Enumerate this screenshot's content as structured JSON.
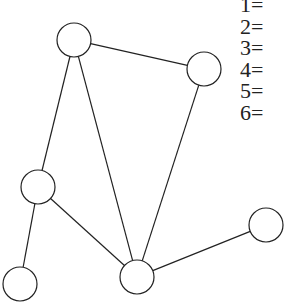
{
  "diagram": {
    "type": "graph",
    "nodes": [
      {
        "id": "n1",
        "cx": 74,
        "cy": 40,
        "r": 17
      },
      {
        "id": "n2",
        "cx": 204,
        "cy": 69,
        "r": 17
      },
      {
        "id": "n3",
        "cx": 38,
        "cy": 187,
        "r": 17
      },
      {
        "id": "n4",
        "cx": 266,
        "cy": 225,
        "r": 17
      },
      {
        "id": "n5",
        "cx": 20,
        "cy": 284,
        "r": 17
      },
      {
        "id": "n6",
        "cx": 137,
        "cy": 277,
        "r": 17
      }
    ],
    "edges": [
      [
        "n1",
        "n2"
      ],
      [
        "n1",
        "n3"
      ],
      [
        "n1",
        "n6"
      ],
      [
        "n2",
        "n6"
      ],
      [
        "n3",
        "n6"
      ],
      [
        "n3",
        "n5"
      ],
      [
        "n6",
        "n4"
      ]
    ]
  },
  "legend": {
    "items": [
      "1=",
      "2=",
      "3=",
      "4=",
      "5=",
      "6="
    ]
  },
  "colors": {
    "stroke": "#222222",
    "background": "#ffffff"
  }
}
